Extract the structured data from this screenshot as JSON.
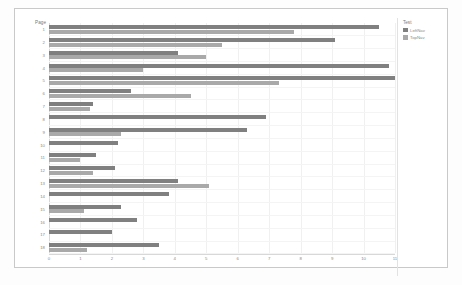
{
  "chart_data": {
    "type": "bar",
    "orientation": "horizontal",
    "title": "",
    "xlabel": "Average Number of Fixations",
    "ylabel": "Page",
    "xlim": [
      0,
      11
    ],
    "xticks": [
      "0",
      "1",
      "2",
      "3",
      "4",
      "5",
      "6",
      "7",
      "8",
      "9",
      "10",
      "11"
    ],
    "grid": true,
    "legend_title": "Test",
    "legend_position": "right",
    "categories": [
      "1",
      "2",
      "3",
      "4",
      "5",
      "6",
      "7",
      "8",
      "9",
      "10",
      "11",
      "12",
      "13",
      "14",
      "15",
      "16",
      "17",
      "18"
    ],
    "series": [
      {
        "name": "LeftNav",
        "color": "#808080",
        "values": [
          10.5,
          9.1,
          4.1,
          10.8,
          11.0,
          2.6,
          1.4,
          6.9,
          6.3,
          2.2,
          1.5,
          2.1,
          4.1,
          3.8,
          2.3,
          2.8,
          2.0,
          3.5
        ]
      },
      {
        "name": "TopNav",
        "color": "#a9a9a9",
        "values": [
          7.8,
          5.5,
          5.0,
          3.0,
          7.3,
          4.5,
          1.3,
          0.0,
          2.3,
          0.0,
          1.0,
          1.4,
          5.1,
          0.0,
          1.1,
          0.0,
          0.0,
          1.2
        ]
      }
    ]
  },
  "legend": {
    "title": "Test",
    "items": [
      {
        "label": "LeftNav",
        "color": "#808080"
      },
      {
        "label": "TopNav",
        "color": "#a9a9a9"
      }
    ]
  },
  "axes": {
    "y_title": "Page",
    "x_title": "Average Number of Fixations"
  }
}
